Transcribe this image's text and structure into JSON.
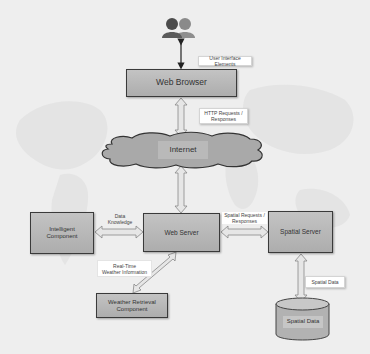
{
  "diagram": {
    "nodes": {
      "users": {
        "label": "Users",
        "icon": "users-icon"
      },
      "web_browser": {
        "label": "Web Browser"
      },
      "internet": {
        "label": "Internet"
      },
      "web_server": {
        "label": "Web Server"
      },
      "intelligent_component": {
        "label": "Intelligent Component",
        "line1": "Intelligent",
        "line2": "Component"
      },
      "spatial_server": {
        "label": "Spatial Server"
      },
      "weather_retrieval": {
        "label": "Weather Retrieval Component",
        "line1": "Weather Retrieval",
        "line2": "Component"
      },
      "spatial_data": {
        "label": "Spatial Data"
      }
    },
    "edge_labels": {
      "ui_elements": "User Interface Elements",
      "http_line1": "HTTP Requests /",
      "http_line2": "Responses",
      "data_line1": "Data",
      "data_line2": "Knowledge",
      "spatial_req_line1": "Spatial Requests /",
      "spatial_req_line2": "Responses",
      "realtime_line1": "Real-Time",
      "realtime_line2": "Weather Information",
      "spatial_data": "Spatial Data"
    },
    "edges": [
      {
        "from": "users",
        "to": "web_browser",
        "label": "User Interface Elements"
      },
      {
        "from": "web_browser",
        "to": "internet",
        "label": "HTTP Requests / Responses"
      },
      {
        "from": "internet",
        "to": "web_server",
        "label": ""
      },
      {
        "from": "intelligent_component",
        "to": "web_server",
        "label": "Data Knowledge"
      },
      {
        "from": "web_server",
        "to": "spatial_server",
        "label": "Spatial Requests / Responses"
      },
      {
        "from": "web_server",
        "to": "weather_retrieval",
        "label": "Real-Time Weather Information"
      },
      {
        "from": "spatial_server",
        "to": "spatial_data",
        "label": "Spatial Data"
      }
    ],
    "colors": {
      "background": "#eeeeee",
      "box_fill": "#b8b8b8",
      "box_border": "#3a3a3a",
      "cloud_fill": "#a9a9a9",
      "arrow_fill": "#e6e6e6"
    }
  }
}
